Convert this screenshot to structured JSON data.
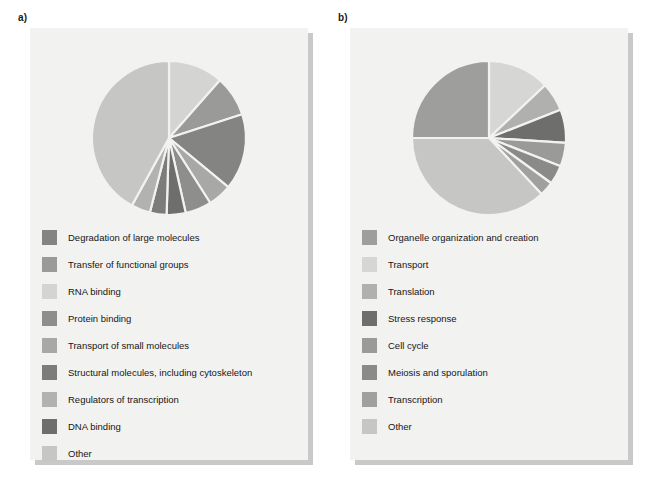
{
  "figure": {
    "background_color": "#ffffff",
    "card_color": "#f2f2f0",
    "card_shadow_color": "#c9c9c9"
  },
  "panels": [
    {
      "label": "a)",
      "name": "panel-a"
    },
    {
      "label": "b)",
      "name": "panel-b"
    }
  ],
  "chart_data": [
    {
      "type": "pie",
      "title": "a)",
      "legend_position": "below",
      "start_angle_deg": 0,
      "direction": "clockwise",
      "categories": [
        "RNA binding",
        "Transfer of functional groups",
        "Degradation of large molecules",
        "Transport of small molecules",
        "Protein binding",
        "DNA binding",
        "Structural molecules, including cytoskeleton",
        "Regulators of transcription",
        "Other"
      ],
      "values": [
        11.5,
        8.5,
        16.0,
        5.0,
        5.5,
        4.0,
        3.5,
        4.0,
        42.0
      ],
      "colors": [
        "#d4d4d2",
        "#9a9a98",
        "#848482",
        "#a8a8a6",
        "#8e8e8c",
        "#6e6e6c",
        "#7c7c7a",
        "#b2b2b0",
        "#c6c6c4"
      ],
      "legend": [
        {
          "label": "Degradation of large molecules",
          "color": "#848482"
        },
        {
          "label": "Transfer of functional groups",
          "color": "#9a9a98"
        },
        {
          "label": "RNA binding",
          "color": "#d4d4d2"
        },
        {
          "label": "Protein binding",
          "color": "#8e8e8c"
        },
        {
          "label": "Transport of small molecules",
          "color": "#a8a8a6"
        },
        {
          "label": "Structural molecules, including cytoskeleton",
          "color": "#7c7c7a"
        },
        {
          "label": "Regulators of transcription",
          "color": "#b2b2b0"
        },
        {
          "label": "DNA binding",
          "color": "#6e6e6c"
        },
        {
          "label": "Other",
          "color": "#c6c6c4"
        }
      ]
    },
    {
      "type": "pie",
      "title": "b)",
      "legend_position": "below",
      "start_angle_deg": 0,
      "direction": "clockwise",
      "categories": [
        "Transport",
        "Translation",
        "Stress response",
        "Cell cycle",
        "Meiosis and sporulation",
        "Transcription",
        "Other",
        "Organelle organization and creation"
      ],
      "values": [
        13.0,
        6.0,
        7.0,
        5.0,
        4.0,
        3.0,
        37.0,
        25.0
      ],
      "colors": [
        "#d6d6d4",
        "#b0b0ae",
        "#6e6e6c",
        "#9a9a98",
        "#8a8a88",
        "#a0a0a0",
        "#c6c6c4",
        "#9e9e9c"
      ],
      "legend": [
        {
          "label": "Organelle organization and creation",
          "color": "#9e9e9c"
        },
        {
          "label": "Transport",
          "color": "#d6d6d4"
        },
        {
          "label": "Translation",
          "color": "#b0b0ae"
        },
        {
          "label": "Stress response",
          "color": "#6e6e6c"
        },
        {
          "label": "Cell cycle",
          "color": "#9a9a98"
        },
        {
          "label": "Meiosis and sporulation",
          "color": "#8a8a88"
        },
        {
          "label": "Transcription",
          "color": "#a0a0a0"
        },
        {
          "label": "Other",
          "color": "#c6c6c4"
        }
      ]
    }
  ]
}
